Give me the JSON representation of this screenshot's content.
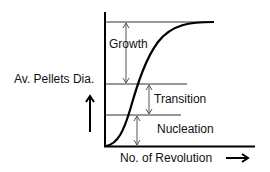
{
  "diagram": {
    "y_axis_label": "Av. Pellets Dia.",
    "x_axis_label": "No. of Revolution",
    "regions": [
      {
        "name": "Growth"
      },
      {
        "name": "Transition"
      },
      {
        "name": "Nucleation"
      }
    ],
    "curve": "sigmoid (S-shaped) growth curve",
    "colors": {
      "line": "#000000",
      "guide": "#333333"
    }
  }
}
